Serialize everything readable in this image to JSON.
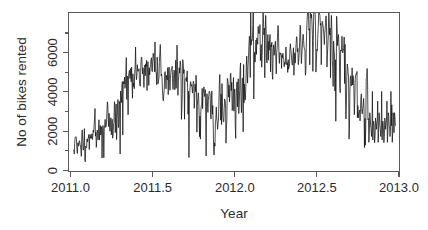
{
  "chart_data": {
    "type": "line",
    "title": "",
    "subtitle": "",
    "xlabel": "Year",
    "ylabel": "No of bikes rented",
    "xlim": [
      2010.97,
      2013.02
    ],
    "ylim": [
      0,
      7400
    ],
    "grid": false,
    "legend": null,
    "legend_position": "none",
    "line_color": "#111111",
    "x_ticks": [
      2011.0,
      2011.5,
      2012.0,
      2012.5,
      2013.0
    ],
    "x_tick_labels": [
      "2011.0",
      "2011.5",
      "2012.0",
      "2012.5",
      "2013.0"
    ],
    "y_ticks": [
      0,
      2000,
      4000,
      6000
    ],
    "y_tick_labels": [
      "0",
      "2000",
      "4000",
      "6000"
    ],
    "series": [
      {
        "name": "Daily bike rentals",
        "x_start": 2011.0,
        "x_step": 0.0027397,
        "values": [
          985,
          801,
          1349,
          1562,
          1600,
          1606,
          1510,
          959,
          822,
          1321,
          1263,
          1162,
          1406,
          1421,
          1248,
          1204,
          1000,
          683,
          1650,
          1927,
          1543,
          981,
          986,
          1416,
          1985,
          506,
          431,
          1167,
          1098,
          1096,
          1501,
          1360,
          1526,
          1550,
          1708,
          1005,
          1623,
          1712,
          1530,
          1605,
          1538,
          1746,
          1472,
          1589,
          1913,
          1815,
          2115,
          2475,
          2927,
          1635,
          1812,
          1107,
          1450,
          1917,
          1807,
          1461,
          1969,
          2402,
          1446,
          1851,
          2134,
          1685,
          1944,
          2077,
          605,
          1872,
          2133,
          1891,
          623,
          1977,
          2132,
          2417,
          2046,
          2056,
          2192,
          2744,
          3239,
          3117,
          2471,
          2077,
          2703,
          2121,
          1865,
          2210,
          2496,
          1693,
          2028,
          2425,
          1536,
          1685,
          2227,
          2252,
          3249,
          3115,
          1795,
          2808,
          3141,
          1471,
          2455,
          2895,
          3348,
          2034,
          2162,
          3267,
          3126,
          795,
          3744,
          3429,
          3204,
          3944,
          4189,
          1683,
          4036,
          4191,
          4073,
          4400,
          3872,
          4058,
          4595,
          5312,
          3351,
          4401,
          4451,
          2633,
          4433,
          4608,
          4714,
          4333,
          4362,
          4803,
          4182,
          4864,
          4105,
          3409,
          4553,
          3958,
          4123,
          3855,
          4575,
          4917,
          5805,
          4660,
          4274,
          4492,
          4978,
          4677,
          4679,
          4758,
          4788,
          4098,
          3982,
          3974,
          4968,
          5312,
          5342,
          4906,
          4548,
          4833,
          4401,
          3915,
          4586,
          4966,
          4460,
          5020,
          4891,
          5180,
          3767,
          4844,
          5119,
          4744,
          4010,
          4835,
          4507,
          4790,
          4991,
          5202,
          5305,
          4708,
          4648,
          5225,
          5515,
          5362,
          5119,
          4649,
          6043,
          4665,
          4629,
          4592,
          4040,
          5336,
          4881,
          4086,
          4258,
          4342,
          5084,
          5538,
          5923,
          5302,
          4458,
          4541,
          4332,
          3784,
          3387,
          3285,
          3606,
          3840,
          4590,
          4656,
          4390,
          3846,
          4475,
          4302,
          4266,
          4845,
          3574,
          4576,
          4866,
          4294,
          3785,
          4326,
          4602,
          4780,
          4792,
          4905,
          4150,
          3820,
          4338,
          4725,
          4694,
          3805,
          4153,
          5191,
          3873,
          4758,
          5895,
          5130,
          3542,
          4248,
          4466,
          4833,
          4580,
          5151,
          5117,
          4563,
          2416,
          2913,
          3644,
          5217,
          5041,
          4570,
          4748,
          2424,
          4195,
          4304,
          4308,
          4381,
          4187,
          4687,
          3894,
          2659,
          3747,
          627,
          3331,
          3669,
          4068,
          4186,
          3974,
          4046,
          3926,
          3649,
          4035,
          4205,
          4109,
          2933,
          3368,
          4067,
          3717,
          4486,
          4195,
          1817,
          3053,
          3392,
          3663,
          3520,
          2765,
          1607,
          2566,
          1495,
          2792,
          3068,
          3071,
          3867,
          2914,
          3613,
          3727,
          3940,
          3614,
          3485,
          3811,
          2594,
          705,
          3322,
          3620,
          3190,
          2743,
          3310,
          3523,
          3740,
          3709,
          3577,
          2739,
          2431,
          3403,
          3750,
          2660,
          3068,
          2209,
          1011,
          754,
          1317,
          1162,
          2302,
          2423,
          2999,
          2485,
          2294,
          1951,
          2236,
          2368,
          3272,
          4098,
          4521,
          3425,
          2376,
          3598,
          2177,
          4097,
          3214,
          2493,
          2311,
          2298,
          2935,
          3376,
          3292,
          3163,
          1301,
          1977,
          2432,
          4339,
          4270,
          4075,
          3456,
          4023,
          3243,
          3624,
          4509,
          4579,
          3761,
          4151,
          2832,
          2947,
          3784,
          4375,
          2802,
          3830,
          3831,
          2169,
          1529,
          3422,
          3922,
          4169,
          3005,
          4154,
          4318,
          2689,
          3129,
          3777,
          4773,
          5062,
          3487,
          2732,
          3389,
          4322,
          4363,
          1834,
          4990,
          3194,
          4066,
          3423,
          3333,
          3956,
          4916,
          5382,
          4569,
          4118,
          4911,
          5298,
          5847,
          6312,
          6192,
          4378,
          7836,
          5892,
          6153,
          6093,
          6230,
          6871,
          8362,
          3372,
          4996,
          5558,
          5102,
          5698,
          6133,
          5459,
          6235,
          6041,
          5936,
          6772,
          6436,
          6457,
          6460,
          6857,
          5169,
          5585,
          5918,
          4862,
          5409,
          6398,
          7460,
          7132,
          6370,
          6691,
          4367,
          6565,
          7290,
          6624,
          5180,
          5060,
          5698,
          6392,
          5191,
          6071,
          5657,
          6217,
          6392,
          4639,
          5917,
          5815,
          6034,
          4484,
          4294,
          5634,
          5906,
          5417,
          5551,
          5870,
          6076,
          5230,
          4547,
          5557,
          5729,
          6489,
          6814,
          6559,
          5487,
          5037,
          5544,
          5527,
          5456,
          5501,
          4806,
          5427,
          5306,
          5511,
          5319,
          5236,
          4881,
          5086,
          4995,
          5204,
          5805,
          5174,
          4974,
          5076,
          4615,
          5217,
          4767,
          4883,
          4920,
          5702,
          5959,
          5709,
          5469,
          5201,
          4965,
          4972,
          5486,
          5771,
          4484,
          5100,
          5538,
          5052,
          5496,
          5969,
          6290,
          6217,
          5572,
          5740,
          4982,
          5202,
          5520,
          6031,
          6830,
          6786,
          5713,
          5035,
          5434,
          5767,
          6183,
          6406,
          6114,
          5805,
          5707,
          5675,
          4486,
          4604,
          5791,
          6602,
          7055,
          7494,
          7736,
          7498,
          6598,
          6664,
          4972,
          7421,
          7363,
          7165,
          7347,
          6930,
          6400,
          4666,
          6114,
          7525,
          7767,
          7870,
          7498,
          6755,
          4634,
          5204,
          5698,
          5629,
          6195,
          6672,
          7216,
          7713,
          7348,
          7300,
          6826,
          6911,
          4977,
          6363,
          7013,
          6954,
          6800,
          6680,
          6368,
          5923,
          6429,
          6635,
          7129,
          7267,
          6783,
          4866,
          5447,
          5892,
          6398,
          7460,
          7132,
          6370,
          6691,
          4367,
          6565,
          7290,
          6624,
          5180,
          4849,
          3961,
          6081,
          5669,
          5430,
          3744,
          5209,
          2330,
          4661,
          7249,
          6647,
          5869,
          6271,
          6389,
          6011,
          5598,
          3912,
          3664,
          5669,
          5620,
          5629,
          6312,
          5559,
          5530,
          5711,
          5688,
          6274,
          4094,
          5938,
          3322,
          2437,
          3126,
          4426,
          5010,
          4884,
          4561,
          4445,
          1495,
          2001,
          3744,
          4380,
          4459,
          3986,
          4084,
          4832,
          4026,
          4468,
          4341,
          3852,
          2639,
          3249,
          4276,
          4479,
          4545,
          4521,
          4661,
          2499,
          3065,
          2487,
          2686,
          2777,
          2847,
          2346,
          2935,
          3451,
          3614,
          2784,
          2676,
          2934,
          3039,
          3400,
          2902,
          1096,
          2465,
          1204,
          2181,
          4333,
          4362,
          4803,
          4182,
          2395,
          2454,
          1341,
          1796,
          2729,
          2557,
          2133,
          1979,
          1613,
          1964,
          3727,
          1450,
          2269,
          2332,
          2045,
          1323,
          1599,
          2480,
          2294,
          1951,
          2236,
          2368,
          3272,
          1341,
          1796,
          2729,
          2557,
          2133,
          1979,
          1613,
          1964,
          3727,
          1450,
          2269,
          2332,
          2045,
          1323,
          1599,
          2480,
          2294,
          1951,
          2236,
          2368,
          3272,
          1341,
          1796,
          2729,
          2557,
          2133,
          1979,
          1613,
          1964,
          3727,
          2114,
          3095,
          1341,
          1796,
          2729,
          2557,
          1796,
          2729,
          2557,
          2133,
          2114
        ]
      }
    ]
  },
  "axes": {
    "y_title": "No of bikes rented",
    "x_title": "Year",
    "y_tick_labels": [
      "0",
      "2000",
      "4000",
      "6000"
    ],
    "x_tick_labels": [
      "2011.0",
      "2011.5",
      "2012.0",
      "2012.5",
      "2013.0"
    ]
  }
}
